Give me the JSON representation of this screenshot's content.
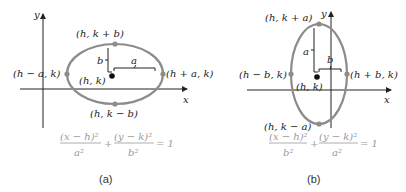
{
  "figure_a": {
    "axis_x": "x",
    "axis_y": "y",
    "top_point": "(h, k + b)",
    "bottom_point": "(h, k − b)",
    "left_point": "(h − a, k)",
    "right_point": "(h + a, k)",
    "center": "(h, k)",
    "semi_vertical": "b",
    "semi_horizontal": "a",
    "eq_num1": "(x − h)²",
    "eq_den1": "a²",
    "eq_num2": "(y − k)²",
    "eq_den2": "b²",
    "eq_plus": "+",
    "eq_rhs": "= 1",
    "caption": "(a)"
  },
  "figure_b": {
    "axis_x": "x",
    "axis_y": "y",
    "top_point": "(h, k + a)",
    "bottom_point": "(h, k − a)",
    "left_point": "(h − b, k)",
    "right_point": "(h + b, k)",
    "center": "(h, k)",
    "semi_vertical": "a",
    "semi_horizontal": "b",
    "eq_num1": "(x − h)²",
    "eq_den1": "b²",
    "eq_num2": "(y − k)²",
    "eq_den2": "a²",
    "eq_plus": "+",
    "eq_rhs": "= 1",
    "caption": "(b)"
  },
  "colors": {
    "ellipse": "#8c8c8c",
    "axis": "#222222",
    "equation": "#9a9a9a"
  }
}
